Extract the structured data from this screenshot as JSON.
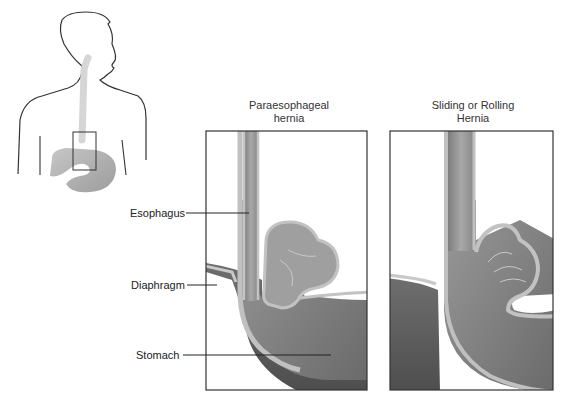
{
  "diagram": {
    "panels": [
      {
        "title_line1": "Paraesophageal",
        "title_line2": "hernia"
      },
      {
        "title_line1": "Sliding or Rolling",
        "title_line2": "Hernia"
      }
    ],
    "labels": {
      "esophagus": "Esophagus",
      "diaphragm": "Diaphragm",
      "stomach": "Stomach"
    },
    "colors": {
      "outline": "#333333",
      "tissue_light": "#b5b5b5",
      "tissue_mid": "#8e8e8e",
      "tissue_dark": "#5e5e5e",
      "esophagus_faint": "#d8d8d8"
    }
  }
}
